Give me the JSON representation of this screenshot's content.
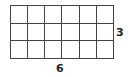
{
  "diagram": {
    "type": "rectangle-grid",
    "columns": 6,
    "rows": 3,
    "labels": {
      "height": "3",
      "width": "6"
    },
    "line_color": "#444444"
  }
}
